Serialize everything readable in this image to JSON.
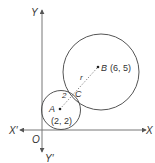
{
  "diagram": {
    "axes": {
      "x_label": "X",
      "x_neg_label": "X′",
      "y_label": "Y",
      "y_neg_label": "Y′",
      "origin_label": "O"
    },
    "points": {
      "A": {
        "name": "A",
        "coords": "(2, 2)"
      },
      "B": {
        "name": "B",
        "coords": "(6, 5)"
      },
      "C": {
        "name": "C"
      }
    },
    "segments": {
      "AC_label": "2",
      "BC_label": "r"
    },
    "colors": {
      "line": "#555555",
      "text": "#333333",
      "background": "#ffffff"
    }
  }
}
